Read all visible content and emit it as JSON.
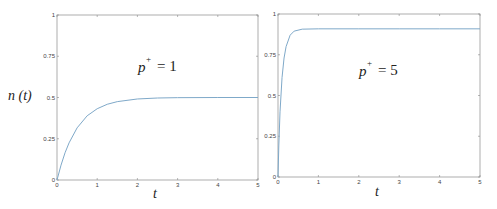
{
  "chart_data": [
    {
      "type": "line",
      "panel": "left",
      "annotation": {
        "base": "p",
        "sup": "+",
        "rest": " = 1"
      },
      "xlabel": "t",
      "ylabel": "n (t)",
      "xlim": [
        0,
        5
      ],
      "ylim": [
        0,
        1
      ],
      "xticks": [
        "0",
        "1",
        "2",
        "3",
        "4",
        "5"
      ],
      "yticks": [
        "0",
        "0.25",
        "0.5",
        "0.75",
        "1"
      ],
      "grid": false,
      "series": [
        {
          "name": "n(t), p+ = 1",
          "color": "#7fa9c9",
          "x": [
            0,
            0.1,
            0.2,
            0.3,
            0.5,
            0.75,
            1.0,
            1.25,
            1.5,
            2.0,
            2.5,
            3.0,
            4.0,
            5.0
          ],
          "y": [
            0,
            0.09,
            0.165,
            0.225,
            0.316,
            0.389,
            0.432,
            0.459,
            0.475,
            0.491,
            0.497,
            0.499,
            0.5,
            0.5
          ]
        }
      ]
    },
    {
      "type": "line",
      "panel": "right",
      "annotation": {
        "base": "p",
        "sup": "+",
        "rest": " = 5"
      },
      "xlabel": "t",
      "ylabel": "",
      "xlim": [
        0,
        5
      ],
      "ylim": [
        0,
        1
      ],
      "xticks": [
        "0",
        "1",
        "2",
        "3",
        "4",
        "5"
      ],
      "yticks": [
        "0",
        "0.25",
        "0.5",
        "0.75",
        "1"
      ],
      "grid": false,
      "series": [
        {
          "name": "n(t), p+ = 5",
          "color": "#7fa9c9",
          "x": [
            0,
            0.02,
            0.05,
            0.1,
            0.15,
            0.2,
            0.3,
            0.4,
            0.6,
            1.0,
            2.0,
            3.0,
            4.0,
            5.0
          ],
          "y": [
            0,
            0.19,
            0.4,
            0.61,
            0.73,
            0.8,
            0.87,
            0.895,
            0.907,
            0.909,
            0.909,
            0.909,
            0.909,
            0.909
          ]
        }
      ]
    }
  ],
  "labels": {
    "left_ylabel": "n (t)",
    "left_xlabel": "t",
    "right_xlabel": "t",
    "left_annot_base": "p",
    "left_annot_sup": "+",
    "left_annot_rest": "= 1",
    "right_annot_base": "p",
    "right_annot_sup": "+",
    "right_annot_rest": "= 5"
  }
}
